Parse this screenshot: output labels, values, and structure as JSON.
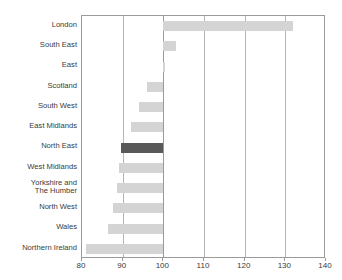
{
  "chart_data": {
    "type": "bar",
    "orientation": "horizontal",
    "title": "",
    "subtitle": "",
    "xlabel": "",
    "ylabel": "",
    "xlim": [
      80,
      140
    ],
    "xticks": [
      80,
      90,
      100,
      110,
      120,
      130,
      140
    ],
    "xtick_labels": [
      "80",
      "90",
      "100",
      "110",
      "120",
      "130",
      "140"
    ],
    "grid": true,
    "gridlines_axis": "x",
    "legend": null,
    "baseline": 100,
    "categories": [
      "London",
      "South East",
      "East",
      "Scotland",
      "South West",
      "East Midlands",
      "North East",
      "West Midlands",
      "Yorkshire and\nThe Humber",
      "North West",
      "Wales",
      "Northern Ireland"
    ],
    "values": [
      132,
      103,
      100,
      96,
      94,
      92,
      89.5,
      89,
      88.5,
      87.5,
      86.5,
      81
    ],
    "highlighted_category": "North East",
    "colors": {
      "bar": "#d4d4d4",
      "bar_highlight": "#595959",
      "gridline": "#b5b5b5",
      "axis": "#9a9a9a",
      "text": "#3a3a3a",
      "background": "#ffffff"
    }
  }
}
